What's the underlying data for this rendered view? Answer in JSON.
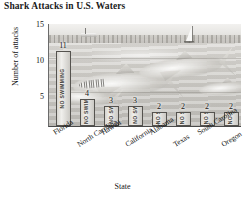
{
  "chart_data": {
    "type": "bar",
    "title": "Shark Attacks in U.S. Waters",
    "xlabel": "State",
    "ylabel": "Number of attacks",
    "categories": [
      "Florida",
      "North Carolina",
      "Hawaii",
      "California",
      "Alabama",
      "Texas",
      "South Carolina",
      "Oregon"
    ],
    "values": [
      11,
      4,
      3,
      3,
      2,
      2,
      2,
      2
    ],
    "ylim": [
      0,
      15
    ],
    "yticks": [
      5,
      10,
      15
    ],
    "grid": true,
    "legend": false,
    "bar_label_text": "NO SWIMMING",
    "background": "grayscale photograph of sharks swimming in ocean water with sailboat on horizon"
  },
  "colors": {
    "bar_fill": "#e0ded9",
    "bar_outline": "#55534f",
    "axis": "#4a4a4a",
    "text": "#141414",
    "water": "#c8c6c1",
    "sky": "#eceae7"
  }
}
